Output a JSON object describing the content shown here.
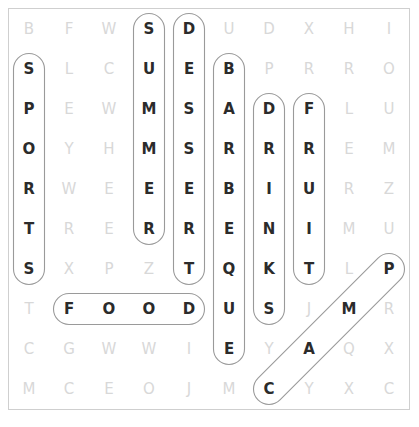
{
  "puzzle": {
    "title": "Word Search",
    "rows": 11,
    "cols": 10,
    "cell_size": 40,
    "origin_x": 9,
    "origin_y": 9,
    "letter_color_plain": "#d8d8d8",
    "letter_color_found": "#2b2b2b",
    "highlight_stroke": "#9a9a9a",
    "border_color": "#cfcfcf",
    "grid": [
      [
        "B",
        "F",
        "W",
        "S",
        "D",
        "U",
        "D",
        "X",
        "H",
        "I"
      ],
      [
        "S",
        "L",
        "C",
        "U",
        "E",
        "B",
        "P",
        "R",
        "R",
        "O"
      ],
      [
        "P",
        "E",
        "W",
        "M",
        "S",
        "A",
        "D",
        "F",
        "L",
        "U"
      ],
      [
        "O",
        "Y",
        "H",
        "M",
        "S",
        "R",
        "R",
        "R",
        "E",
        "M"
      ],
      [
        "R",
        "W",
        "E",
        "E",
        "E",
        "B",
        "I",
        "U",
        "R",
        "Z"
      ],
      [
        "T",
        "R",
        "E",
        "R",
        "R",
        "E",
        "N",
        "I",
        "M",
        "U"
      ],
      [
        "S",
        "X",
        "P",
        "Z",
        "T",
        "Q",
        "K",
        "T",
        "L",
        "P"
      ],
      [
        "T",
        "F",
        "O",
        "O",
        "D",
        "U",
        "S",
        "J",
        "M",
        "R"
      ],
      [
        "C",
        "G",
        "W",
        "W",
        "I",
        "E",
        "Y",
        "A",
        "Q",
        "X"
      ],
      [
        "M",
        "C",
        "E",
        "O",
        "J",
        "M",
        "C",
        "Y",
        "X",
        "C"
      ]
    ],
    "grid_full": [
      [
        "B",
        "F",
        "W",
        "S",
        "D",
        "U",
        "D",
        "X",
        "H",
        "I"
      ],
      [
        "S",
        "L",
        "C",
        "U",
        "E",
        "B",
        "P",
        "R",
        "R",
        "O"
      ],
      [
        "P",
        "E",
        "W",
        "M",
        "S",
        "A",
        "D",
        "F",
        "L",
        "U"
      ],
      [
        "O",
        "Y",
        "H",
        "M",
        "S",
        "R",
        "R",
        "R",
        "E",
        "M"
      ],
      [
        "R",
        "W",
        "E",
        "E",
        "E",
        "B",
        "I",
        "U",
        "R",
        "Z"
      ],
      [
        "T",
        "R",
        "E",
        "R",
        "R",
        "E",
        "N",
        "I",
        "M",
        "U"
      ],
      [
        "S",
        "X",
        "P",
        "Z",
        "T",
        "Q",
        "K",
        "T",
        "L",
        "P"
      ],
      [
        "T",
        "F",
        "O",
        "O",
        "D",
        "U",
        "S",
        "J",
        "M",
        "R"
      ],
      [
        "C",
        "G",
        "W",
        "W",
        "I",
        "E",
        "Y",
        "A",
        "Q",
        "X"
      ],
      [
        "M",
        "C",
        "E",
        "O",
        "J",
        "M",
        "C",
        "Y",
        "X",
        "C"
      ]
    ],
    "found_words": [
      {
        "word": "SPORTS",
        "direction": "vertical-down",
        "start": {
          "row": 1,
          "col": 0
        },
        "end": {
          "row": 6,
          "col": 0
        },
        "letters": [
          "S",
          "P",
          "O",
          "R",
          "T",
          "S"
        ]
      },
      {
        "word": "SUMMER",
        "direction": "vertical-down",
        "start": {
          "row": 0,
          "col": 3
        },
        "end": {
          "row": 5,
          "col": 3
        },
        "letters": [
          "S",
          "U",
          "M",
          "M",
          "E",
          "R"
        ]
      },
      {
        "word": "DESSERT",
        "direction": "vertical-down",
        "start": {
          "row": 0,
          "col": 4
        },
        "end": {
          "row": 6,
          "col": 4
        },
        "letters": [
          "D",
          "E",
          "S",
          "S",
          "E",
          "R",
          "T"
        ]
      },
      {
        "word": "BARBEQUE",
        "direction": "vertical-down",
        "start": {
          "row": 1,
          "col": 5
        },
        "end": {
          "row": 8,
          "col": 5
        },
        "letters": [
          "B",
          "A",
          "R",
          "B",
          "E",
          "Q",
          "U",
          "E"
        ]
      },
      {
        "word": "DRINKS",
        "direction": "vertical-down",
        "start": {
          "row": 2,
          "col": 6
        },
        "end": {
          "row": 7,
          "col": 6
        },
        "letters": [
          "D",
          "R",
          "I",
          "N",
          "K",
          "S"
        ]
      },
      {
        "word": "FRUIT",
        "direction": "vertical-down",
        "start": {
          "row": 2,
          "col": 7
        },
        "end": {
          "row": 6,
          "col": 7
        },
        "letters": [
          "F",
          "R",
          "U",
          "I",
          "T"
        ]
      },
      {
        "word": "FOOD",
        "direction": "horizontal-right",
        "start": {
          "row": 7,
          "col": 1
        },
        "end": {
          "row": 7,
          "col": 4
        },
        "letters": [
          "F",
          "O",
          "O",
          "D"
        ]
      },
      {
        "word": "CAMP",
        "direction": "diagonal-up-right",
        "start": {
          "row": 9,
          "col": 6
        },
        "end": {
          "row": 6,
          "col": 9
        },
        "letters": [
          "C",
          "A",
          "M",
          "P"
        ]
      }
    ]
  }
}
